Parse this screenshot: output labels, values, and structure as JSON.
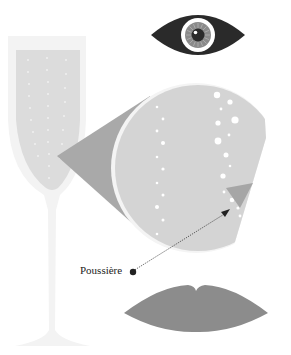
{
  "diagram": {
    "labels": {
      "dust": "Poussière"
    },
    "elements": [
      {
        "name": "eye",
        "description": "eye observing"
      },
      {
        "name": "champagne-glass",
        "description": "flute glass with bubbles"
      },
      {
        "name": "magnifier",
        "description": "magnified view of liquid with bubbles"
      },
      {
        "name": "dust-particle",
        "description": "particle pointed to by annotation arrow"
      },
      {
        "name": "lips",
        "description": "lips"
      }
    ],
    "colors": {
      "background": "#ffffff",
      "glass_outline": "#f3f3f3",
      "liquid": "#dcdcdc",
      "cone": "#a9a9a9",
      "magnifier_fill": "#d4d4d4",
      "eye_dark": "#2a2a2a",
      "iris": "#8a8a8a",
      "lips": "#8c8c8c",
      "pointer": "#222222"
    }
  }
}
